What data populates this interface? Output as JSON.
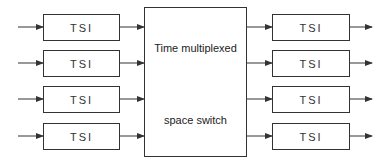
{
  "diagram": {
    "type": "block-diagram",
    "input_tsis": [
      {
        "label": "TSI"
      },
      {
        "label": "TSI"
      },
      {
        "label": "TSI"
      },
      {
        "label": "TSI"
      }
    ],
    "switch": {
      "label_line1": "Time multiplexed",
      "label_line2": "space switch"
    },
    "output_tsis": [
      {
        "label": "TSI"
      },
      {
        "label": "TSI"
      },
      {
        "label": "TSI"
      },
      {
        "label": "TSI"
      }
    ],
    "colors": {
      "line": "#333333",
      "background": "#ffffff"
    }
  }
}
